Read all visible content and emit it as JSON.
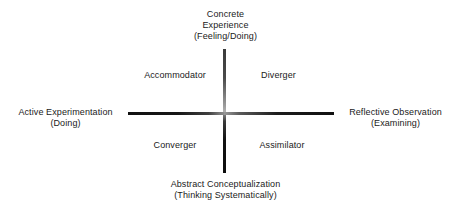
{
  "diagram": {
    "type": "quadrant",
    "background_color": "#ffffff",
    "text_color": "#1a1a1a",
    "axis_color": "#111111"
  },
  "axes": {
    "vertical": {
      "name": "concrete-abstract-axis",
      "top": {
        "line1": "Concrete",
        "line2": "Experience",
        "line3": "(Feeling/Doing)"
      },
      "bottom": {
        "line1": "Abstract Conceptualization",
        "line2": "(Thinking Systematically)"
      }
    },
    "horizontal": {
      "name": "active-reflective-axis",
      "left": {
        "line1": "Active Experimentation",
        "line2": "(Doing)"
      },
      "right": {
        "line1": "Reflective Observation",
        "line2": "(Examining)"
      }
    }
  },
  "quadrants": [
    {
      "id": "accommodator",
      "label": "Accommodator",
      "position": "top-left"
    },
    {
      "id": "diverger",
      "label": "Diverger",
      "position": "top-right"
    },
    {
      "id": "converger",
      "label": "Converger",
      "position": "bottom-left"
    },
    {
      "id": "assimilator",
      "label": "Assimilator",
      "position": "bottom-right"
    }
  ]
}
